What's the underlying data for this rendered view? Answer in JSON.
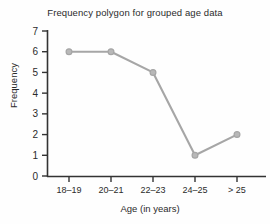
{
  "chart_data": {
    "type": "line",
    "title": "Frequency polygon for grouped age data",
    "xlabel": "Age (in years)",
    "ylabel": "Frequency",
    "categories": [
      "18–19",
      "20–21",
      "22–23",
      "24–25",
      "> 25"
    ],
    "values": [
      6,
      6,
      5,
      1,
      2
    ],
    "yticks": [
      "0",
      "1",
      "2",
      "3",
      "4",
      "5",
      "6",
      "7"
    ],
    "ylim": [
      0,
      7
    ],
    "grid": false,
    "legend": "none",
    "marker": "circle",
    "colors": {
      "line": "#a6a6a6",
      "marker": "#a6a6a6",
      "axis": "#333333",
      "text": "#2b2b2b",
      "background": "#fefefe"
    }
  }
}
